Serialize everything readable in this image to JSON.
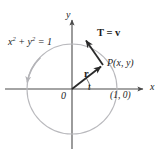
{
  "figure": {
    "width": 163,
    "height": 162,
    "background_color": "#ffffff"
  },
  "colors": {
    "axis": "#4a4a4a",
    "circle": "#b9b9bd",
    "vector": "#2a2a2a",
    "text": "#1c1c1c",
    "arc": "#6a6a6a"
  },
  "axes": {
    "x_label": "x",
    "y_label": "y",
    "origin_label": "0",
    "x_axis": {
      "x_start": 5,
      "x_end": 145,
      "y": 89
    },
    "y_axis": {
      "y_start": 18,
      "y_end": 149,
      "x": 72
    }
  },
  "circle": {
    "center_x": 72,
    "center_y": 89,
    "radius": 45,
    "equation": "x2 + y2 = 1",
    "equation_parts": {
      "x_base": "x",
      "x_exp": "2",
      "plus": "+",
      "y_base": "y",
      "y_exp": "2",
      "equals": "=",
      "value": "1"
    },
    "direction": "counterclockwise"
  },
  "points": {
    "p": {
      "label": "P(x, y)",
      "x": 103,
      "y": 65
    },
    "one_zero": {
      "label": "(1, 0)",
      "x": 117,
      "y": 89
    },
    "origin": {
      "label": "0",
      "x": 72,
      "y": 89
    }
  },
  "vectors": {
    "r": {
      "label": "r",
      "from_x": 72,
      "from_y": 89,
      "to_x": 103,
      "to_y": 65
    },
    "t": {
      "label": "T = v",
      "from_x": 103,
      "from_y": 65,
      "to_x": 84,
      "to_y": 38
    }
  },
  "angle": {
    "label": "t",
    "start_deg": 0,
    "end_deg": 38
  }
}
